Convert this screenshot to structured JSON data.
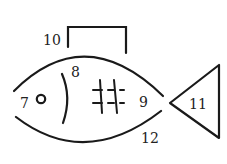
{
  "diagram": {
    "type": "fish-shape line drawing with numbered parts",
    "labels": {
      "l7": "7",
      "l8": "8",
      "l9": "9",
      "l10": "10",
      "l11": "11",
      "l12": "12"
    },
    "parts": [
      {
        "id": "7",
        "name": "eye"
      },
      {
        "id": "8",
        "name": "gill"
      },
      {
        "id": "9",
        "name": "body-rear"
      },
      {
        "id": "10",
        "name": "dorsal-fin"
      },
      {
        "id": "11",
        "name": "tail"
      },
      {
        "id": "12",
        "name": "belly"
      }
    ],
    "line_color": "#1a1a1a",
    "background": "#ffffff"
  }
}
